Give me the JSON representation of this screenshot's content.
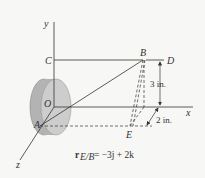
{
  "diagram": {
    "axes": {
      "x_label": "x",
      "y_label": "y",
      "z_label": "z"
    },
    "points": {
      "origin": "O",
      "A": "A",
      "B": "B",
      "C": "C",
      "D": "D",
      "E": "E"
    },
    "dimensions": {
      "vertical": "3 in.",
      "depth": "2 in."
    },
    "equation": {
      "lhs_main": "r",
      "lhs_sub": "E/B",
      "rhs": "= −3j + 2k"
    },
    "colors": {
      "disc_face": "#c9c9c9",
      "disc_rim": "#a9a9a9",
      "line": "#333333"
    }
  }
}
